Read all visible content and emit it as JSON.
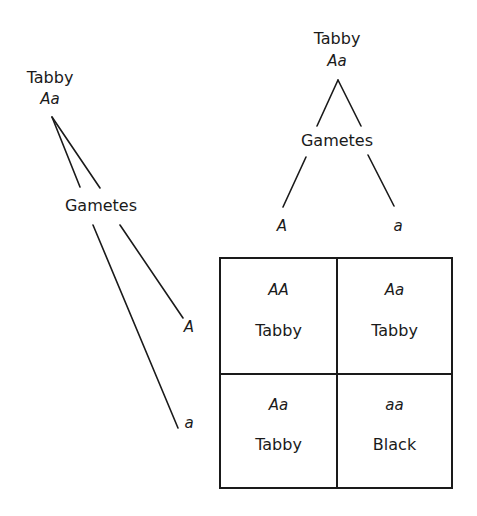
{
  "top_parent": {
    "phenotype": "Tabby",
    "genotype": "Aa"
  },
  "top_gametes": {
    "label": "Gametes",
    "alleles": [
      "A",
      "a"
    ]
  },
  "left_parent": {
    "phenotype": "Tabby",
    "genotype": "Aa"
  },
  "left_gametes": {
    "label": "Gametes",
    "alleles": [
      "A",
      "a"
    ]
  },
  "punnett_square": {
    "cells": [
      {
        "genotype": "AA",
        "phenotype": "Tabby"
      },
      {
        "genotype": "Aa",
        "phenotype": "Tabby"
      },
      {
        "genotype": "Aa",
        "phenotype": "Tabby"
      },
      {
        "genotype": "aa",
        "phenotype": "Black"
      }
    ]
  }
}
